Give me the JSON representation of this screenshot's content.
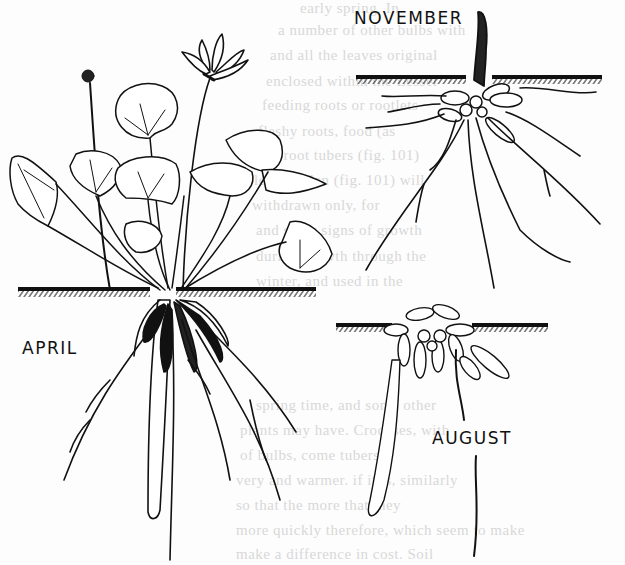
{
  "figure": {
    "labels": {
      "november": "NOVEMBER",
      "april": "APRIL",
      "august": "AUGUST"
    },
    "colors": {
      "ink": "#111111",
      "paper": "#fdfdfd",
      "bleed_text": "#d8d8d8"
    }
  },
  "bleed_through_text": [
    "early spring. In",
    "a number of other bulbs with",
    "and all the leaves original",
    "enclosed within the Lesser",
    "feeding roots or rootlets",
    "fleshy roots, food (as",
    "and root tubers (fig. 101)",
    "lesser celan (fig. 101) will",
    "withdrawn only, for",
    "and show signs of growth",
    "during growth through the",
    "winter, and used in the",
    "spring time, and some other",
    "plants may have. Crocuses, with",
    "of bulbs, come tubers",
    "very and warmer. if it is, similarly",
    "so that the more that they",
    "more quickly therefore, which seem to make",
    "make a difference in cost. Soil"
  ]
}
